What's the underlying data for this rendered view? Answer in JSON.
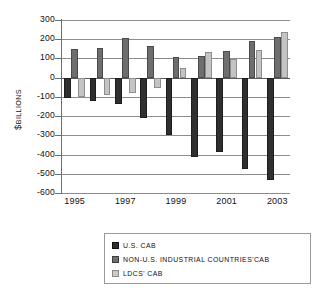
{
  "chart_data": {
    "type": "bar",
    "title": "",
    "subtitle": "",
    "xlabel": "",
    "ylabel": "$ BILLIONS",
    "ylabel_symbol": "$",
    "ylabel_word": "BILLIONS",
    "ylim": [
      -600,
      300
    ],
    "ytick_step": 100,
    "grid": true,
    "legend_position": "bottom",
    "categories": [
      "1995",
      "1996",
      "1997",
      "1998",
      "1999",
      "2000",
      "2001",
      "2002",
      "2003"
    ],
    "visible_tick_labels": [
      "1995",
      "1997",
      "1999",
      "2001",
      "2003"
    ],
    "yticks": [
      300,
      200,
      100,
      0,
      -100,
      -200,
      -300,
      -400,
      -500,
      -600
    ],
    "ytick_labels": [
      "300",
      "200",
      "100",
      "0",
      "-100",
      "-200",
      "-300",
      "-400",
      "-500",
      "-600"
    ],
    "series": [
      {
        "name": "U.S. CAB",
        "color": "#2f2f2f",
        "values": [
          -105,
          -120,
          -137,
          -212,
          -300,
          -415,
          -389,
          -475,
          -530
        ]
      },
      {
        "name": "NON-U.S. INDUSTRIAL COUNTRIES' CAB",
        "color": "#6e6e6e",
        "values": [
          148,
          152,
          207,
          165,
          110,
          115,
          137,
          193,
          210
        ]
      },
      {
        "name": "LDCS' CAB",
        "color": "#c4c4c4",
        "values": [
          -100,
          -88,
          -78,
          -55,
          48,
          135,
          95,
          143,
          237
        ]
      }
    ]
  },
  "legend": {
    "items": [
      {
        "label": "U.S. CAB",
        "swatch": "series-0-swatch"
      },
      {
        "label": "NON-U.S. INDUSTRIAL COUNTRIES'CAB",
        "swatch": "series-1-swatch"
      },
      {
        "label": "LDCS' CAB",
        "swatch": "series-2-swatch"
      }
    ]
  }
}
